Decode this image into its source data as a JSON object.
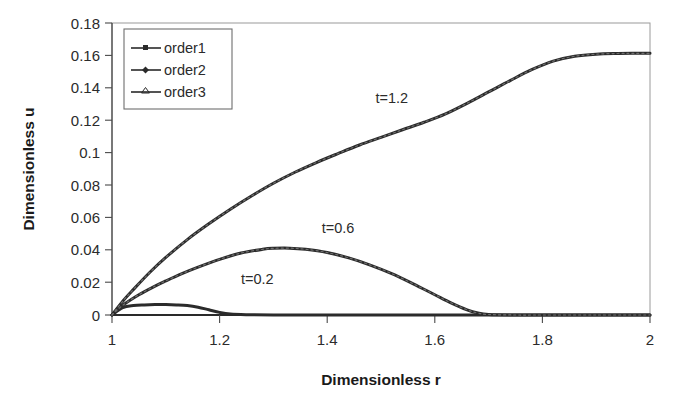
{
  "chart_data": {
    "type": "line",
    "title": "",
    "xlabel": "Dimensionless r",
    "ylabel": "Dimensionless u",
    "xlim": [
      1,
      2
    ],
    "ylim": [
      0,
      0.18
    ],
    "xticks": [
      "1",
      "1.2",
      "1.4",
      "1.6",
      "1.8",
      "2"
    ],
    "xtick_values": [
      1,
      1.2,
      1.4,
      1.6,
      1.8,
      2
    ],
    "yticks": [
      "0",
      "0.02",
      "0.04",
      "0.06",
      "0.08",
      "0.1",
      "0.12",
      "0.14",
      "0.16",
      "0.18"
    ],
    "ytick_values": [
      0,
      0.02,
      0.04,
      0.06,
      0.08,
      0.1,
      0.12,
      0.14,
      0.16,
      0.18
    ],
    "grid": false,
    "legend_position": "upper-left",
    "legend": [
      "order1",
      "order2",
      "order3"
    ],
    "annotations": [
      {
        "text": "t=0.2",
        "x": 1.27,
        "y": 0.019
      },
      {
        "text": "t=0.6",
        "x": 1.42,
        "y": 0.0505
      },
      {
        "text": "t=1.2",
        "x": 1.52,
        "y": 0.1305
      }
    ],
    "series": [
      {
        "name": "t=0.2",
        "label": "t=0.2",
        "color": "#2b2b2b",
        "x": [
          1.0,
          1.02,
          1.04,
          1.06,
          1.08,
          1.1,
          1.12,
          1.14,
          1.16,
          1.18,
          1.2,
          1.22,
          1.25,
          1.3,
          1.4,
          1.5,
          1.6,
          1.7,
          1.8,
          1.9,
          2.0
        ],
        "y": [
          0.0,
          0.0045,
          0.0058,
          0.0062,
          0.0064,
          0.0064,
          0.0062,
          0.0058,
          0.0048,
          0.0032,
          0.0016,
          0.0006,
          0.0002,
          0.0,
          0.0,
          0.0,
          0.0,
          0.0,
          0.0,
          0.0,
          0.0
        ]
      },
      {
        "name": "t=0.6",
        "label": "t=0.6",
        "color": "#2b2b2b",
        "x": [
          1.0,
          1.02,
          1.05,
          1.08,
          1.1,
          1.13,
          1.16,
          1.2,
          1.24,
          1.28,
          1.3,
          1.33,
          1.36,
          1.4,
          1.44,
          1.48,
          1.52,
          1.56,
          1.6,
          1.63,
          1.66,
          1.68,
          1.7,
          1.75,
          1.8,
          1.9,
          2.0
        ],
        "y": [
          0.0,
          0.006,
          0.0125,
          0.0178,
          0.021,
          0.0255,
          0.0295,
          0.0343,
          0.0382,
          0.0405,
          0.0411,
          0.0412,
          0.0405,
          0.0385,
          0.0352,
          0.0308,
          0.0255,
          0.0192,
          0.0125,
          0.0075,
          0.0032,
          0.0012,
          0.0003,
          0.0,
          0.0,
          0.0,
          0.0
        ]
      },
      {
        "name": "t=1.2",
        "label": "t=1.2",
        "color": "#2b2b2b",
        "x": [
          1.0,
          1.02,
          1.04,
          1.07,
          1.1,
          1.14,
          1.18,
          1.22,
          1.26,
          1.3,
          1.34,
          1.38,
          1.42,
          1.46,
          1.5,
          1.54,
          1.58,
          1.62,
          1.66,
          1.7,
          1.74,
          1.78,
          1.82,
          1.86,
          1.9,
          1.94,
          1.97,
          2.0
        ],
        "y": [
          0.0,
          0.0085,
          0.0158,
          0.0262,
          0.0355,
          0.0465,
          0.0562,
          0.0652,
          0.0735,
          0.0812,
          0.088,
          0.094,
          0.0995,
          0.1048,
          0.1095,
          0.1142,
          0.1188,
          0.124,
          0.1305,
          0.1375,
          0.1445,
          0.1512,
          0.1565,
          0.1595,
          0.1608,
          0.1612,
          0.1613,
          0.1613
        ]
      }
    ]
  },
  "legend": {
    "entries": [
      {
        "label": "order1",
        "marker": "square"
      },
      {
        "label": "order2",
        "marker": "diamond"
      },
      {
        "label": "order3",
        "marker": "triangle"
      }
    ]
  },
  "axes": {
    "x_title": "Dimensionless r",
    "y_title": "Dimensionless u"
  }
}
